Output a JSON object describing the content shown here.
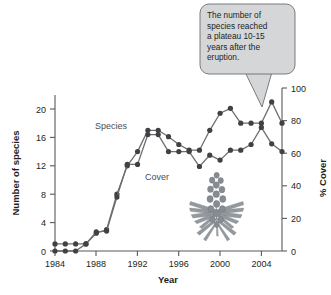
{
  "chart_data": {
    "type": "line",
    "title": "",
    "xlabel": "Year",
    "ylabel": "Number of species",
    "y2label": "% Cover",
    "xlim": [
      1984,
      2006
    ],
    "ylim": [
      0,
      22
    ],
    "y2lim": [
      0,
      100
    ],
    "xticks": [
      1984,
      1988,
      1992,
      1996,
      2000,
      2004
    ],
    "yticks": [
      0,
      4,
      8,
      12,
      16,
      20
    ],
    "y2ticks": [
      0,
      20,
      40,
      60,
      80,
      100
    ],
    "grid": false,
    "legend": "inline-labels",
    "x": [
      1984,
      1985,
      1986,
      1987,
      1988,
      1989,
      1990,
      1991,
      1992,
      1993,
      1994,
      1995,
      1996,
      1997,
      1998,
      1999,
      2000,
      2001,
      2002,
      2003,
      2004,
      2005,
      2006
    ],
    "series": [
      {
        "name": "Species",
        "axis": "left",
        "label": "Species",
        "values": [
          1,
          1,
          1,
          1,
          2.5,
          3,
          8,
          12,
          14,
          17,
          17,
          16.1,
          15,
          14.2,
          14.2,
          17,
          19.4,
          20.1,
          18,
          18,
          18,
          21,
          18
        ]
      },
      {
        "name": "Cover",
        "axis": "right",
        "label": "Cover",
        "values": [
          0,
          0,
          0,
          1,
          2.7,
          2.8,
          7.6,
          12.2,
          12.2,
          16.4,
          16.4,
          14,
          14,
          14,
          11.9,
          13.5,
          12.8,
          14.2,
          14.2,
          15,
          17.4,
          15.1,
          14
        ]
      }
    ],
    "series_values_right_axis_percent": {
      "Cover": [
        0,
        0,
        0,
        5,
        12,
        13,
        35,
        55,
        55,
        75,
        75,
        64,
        64,
        64,
        54,
        61,
        58,
        65,
        65,
        68,
        79,
        69,
        64
      ]
    },
    "annotation": {
      "text": "The number of\nspecies reached\na plateau 10-15\nyears after the\neruption.",
      "points_to": "species-2004-peak"
    },
    "illustration": "lupine-plant",
    "colors": {
      "line": "#6d6e71",
      "marker": "#414042",
      "axis": "#58595b",
      "callout_fill": "#d5d6d8",
      "callout_stroke": "#6d6e71",
      "text": "#231f20"
    }
  }
}
